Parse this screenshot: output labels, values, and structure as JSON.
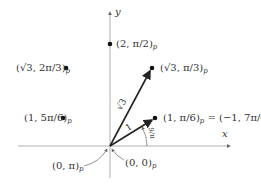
{
  "axes": {
    "x_label": "x",
    "y_label": "y"
  },
  "points": [
    {
      "id": "p1",
      "label": "(2, π/2)",
      "sub": "p",
      "r": "2",
      "theta": "π/2"
    },
    {
      "id": "p2",
      "label": "(√3, π/3)",
      "sub": "p",
      "r": "√3",
      "theta": "π/3"
    },
    {
      "id": "p3",
      "label": "(√3, 2π/3)",
      "sub": "p",
      "r": "√3",
      "theta": "2π/3"
    },
    {
      "id": "p4",
      "label": "(1, 5π/6)",
      "sub": "p",
      "r": "1",
      "theta": "5π/6"
    },
    {
      "id": "p5",
      "label": "(1, π/6)",
      "sub": "p",
      "equals": "= (−1, 7π/6)",
      "r": "1",
      "theta": "π/6"
    }
  ],
  "origin_labels": [
    {
      "label": "(0, π)",
      "sub": "p"
    },
    {
      "label": "(0, 0)",
      "sub": "p"
    }
  ],
  "vectors": [
    {
      "length_label": "√3",
      "to": "p2"
    },
    {
      "length_label": "1",
      "to": "p5"
    }
  ],
  "angle_label": "π/6"
}
